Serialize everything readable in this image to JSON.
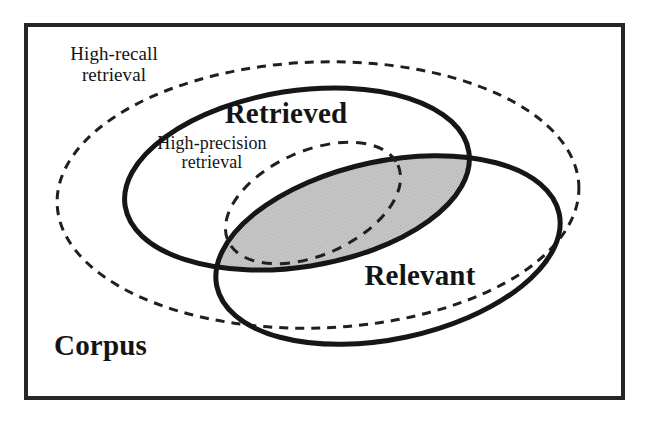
{
  "figure": {
    "kind": "venn-diagram",
    "background_color": "#ffffff",
    "ink_color": "#141414",
    "shade_color": "#c8c8c8"
  },
  "frame": {
    "name": "corpus-frame",
    "stroke_color": "#262626",
    "stroke_width": 4
  },
  "labels": {
    "corpus": "Corpus",
    "retrieved": "Retrieved",
    "relevant": "Relevant",
    "high_recall_line1": "High-recall",
    "high_recall_line2": "retrieval",
    "high_precision_line1": "High-precision",
    "high_precision_line2": "retrieval"
  },
  "shapes": {
    "high_recall_ellipse": {
      "name": "high-recall-retrieval-ellipse",
      "style": "dashed",
      "cx": 318,
      "cy": 195,
      "rx": 261,
      "ry": 133,
      "rotate": -2,
      "stroke_color": "#1f1f1f",
      "stroke_width": 3,
      "dash": "9 7",
      "fill": "none"
    },
    "retrieved_ellipse": {
      "name": "retrieved-ellipse",
      "style": "solid",
      "cx": 297,
      "cy": 179,
      "rx": 174,
      "ry": 88,
      "rotate": -9,
      "stroke_color": "#161616",
      "stroke_width": 5,
      "fill": "none"
    },
    "relevant_ellipse": {
      "name": "relevant-ellipse",
      "style": "solid",
      "cx": 388,
      "cy": 250,
      "rx": 175,
      "ry": 89,
      "rotate": -12,
      "stroke_color": "#161616",
      "stroke_width": 5,
      "fill": "none"
    },
    "high_precision_ellipse": {
      "name": "high-precision-retrieval-ellipse",
      "style": "dashed",
      "cx": 313,
      "cy": 203,
      "rx": 93,
      "ry": 52,
      "rotate": -24,
      "stroke_color": "#1f1f1f",
      "stroke_width": 3,
      "dash": "10 8",
      "fill": "none"
    },
    "intersection_shade": {
      "name": "retrieved-relevant-intersection",
      "description": "Lens-shaped overlap of Retrieved and Relevant, filled with gray halftone",
      "fill": "#c8c8c8"
    }
  },
  "legend_meaning": [
    {
      "region": "Corpus",
      "description": "All documents, the bounding rectangle"
    },
    {
      "region": "Retrieved",
      "description": "Documents returned by the system"
    },
    {
      "region": "Relevant",
      "description": "Documents that answer the information need"
    },
    {
      "region": "Retrieved and Relevant",
      "description": "Shaded overlap region"
    },
    {
      "region": "High-recall retrieval",
      "description": "Large dashed ellipse covering most of the corpus"
    },
    {
      "region": "High-precision retrieval",
      "description": "Small dashed ellipse inside the overlap"
    }
  ]
}
